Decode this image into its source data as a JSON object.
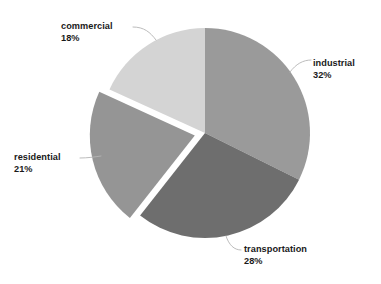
{
  "background_color": "#ffffff",
  "chart_data": {
    "type": "pie",
    "title": "",
    "subtitle": "",
    "xlabel": "",
    "ylabel": "",
    "legend_position": "none",
    "labels_position": "outside",
    "grid": false,
    "start_angle_deg": 90,
    "direction": "clockwise",
    "categories": [
      "industrial",
      "transportation",
      "residential",
      "commercial"
    ],
    "values": [
      32,
      28,
      21,
      18
    ],
    "value_suffix": "%",
    "colors": [
      "#9a9a9a",
      "#6e6e6e",
      "#959595",
      "#d4d4d4"
    ],
    "exploded": [
      "residential"
    ],
    "explode_offset": 0.1,
    "slices": [
      {
        "name": "industrial",
        "label": "industrial",
        "value": 32,
        "value_text": "32%",
        "color": "#9a9a9a",
        "exploded": false,
        "start_deg": 0,
        "end_deg": 115.2
      },
      {
        "name": "transportation",
        "label": "transportation",
        "value": 28,
        "value_text": "28%",
        "color": "#6e6e6e",
        "exploded": false,
        "start_deg": 115.2,
        "end_deg": 216.0
      },
      {
        "name": "residential",
        "label": "residential",
        "value": 21,
        "value_text": "21%",
        "color": "#959595",
        "exploded": true,
        "start_deg": 216.0,
        "end_deg": 291.6
      },
      {
        "name": "commercial",
        "label": "commercial",
        "value": 18,
        "value_text": "18%",
        "color": "#d4d4d4",
        "exploded": false,
        "start_deg": 291.6,
        "end_deg": 360.0
      }
    ]
  },
  "labels": {
    "commercial": {
      "name": "commercial",
      "pct": "18%"
    },
    "industrial": {
      "name": "industrial",
      "pct": "32%"
    },
    "residential": {
      "name": "residential",
      "pct": "21%"
    },
    "transportation": {
      "name": "transportation",
      "pct": "28%"
    }
  }
}
